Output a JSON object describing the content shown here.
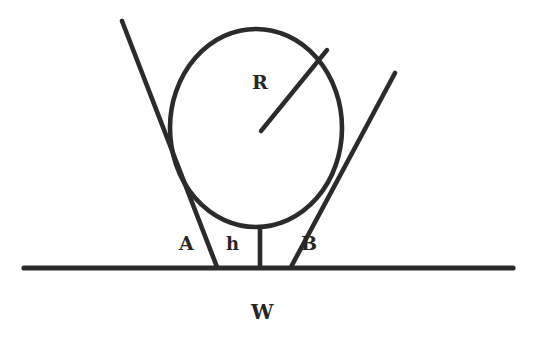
{
  "figure": {
    "title": "",
    "background_color": "#ffffff",
    "stroke_color": "#2b2b2b",
    "canvas": {
      "width": 536,
      "height": 346
    },
    "labels": {
      "radius": "R",
      "left_contact": "A",
      "height": "h",
      "right_contact": "B",
      "ground": "W"
    },
    "geometry": {
      "circle": {
        "name": "main-circle",
        "center_x": 256,
        "center_y": 128,
        "radius_x": 86,
        "radius_y": 99,
        "stroke_width": 4.6
      },
      "radius_line": {
        "name": "radius-line",
        "x1": 261,
        "y1": 131,
        "x2": 327,
        "y2": 50,
        "stroke_width": 4.4
      },
      "left_wedge_line": {
        "name": "left-wedge-line",
        "x1": 122,
        "y1": 21,
        "x2": 217,
        "y2": 267,
        "stroke_width": 4.6
      },
      "right_wedge_line": {
        "name": "right-wedge-line",
        "x1": 395,
        "y1": 73,
        "x2": 291,
        "y2": 267,
        "stroke_width": 4.6
      },
      "height_line": {
        "name": "height-line",
        "x1": 260,
        "y1": 228,
        "x2": 260,
        "y2": 267,
        "stroke_width": 4.6
      },
      "ground_line": {
        "name": "ground-line",
        "x1": 24,
        "y1": 268,
        "x2": 513,
        "y2": 268,
        "stroke_width": 5.2
      }
    }
  }
}
